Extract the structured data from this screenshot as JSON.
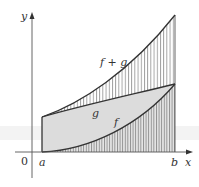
{
  "figure": {
    "type": "area-between-curves",
    "axes": {
      "x_label": "x",
      "y_label": "y",
      "origin_label": "0"
    },
    "interval": {
      "start_label": "a",
      "end_label": "b"
    },
    "curves": [
      {
        "name": "f+g",
        "label": "f + g",
        "shape": "increasing convex",
        "region_above": "g",
        "fill": "vertical hatching"
      },
      {
        "name": "g",
        "label": "g",
        "shape": "increasing, nearly linear",
        "region_above": "f",
        "fill": "light gray"
      },
      {
        "name": "f",
        "label": "f",
        "shape": "increasing convex from zero",
        "region_above": "x-axis",
        "fill": "vertical hatching on gray"
      }
    ],
    "colors": {
      "axis": "#555555",
      "curve": "#333333",
      "gray_fill": "#dcdcdc",
      "hatch": "#666666",
      "background": "#ffffff"
    }
  }
}
